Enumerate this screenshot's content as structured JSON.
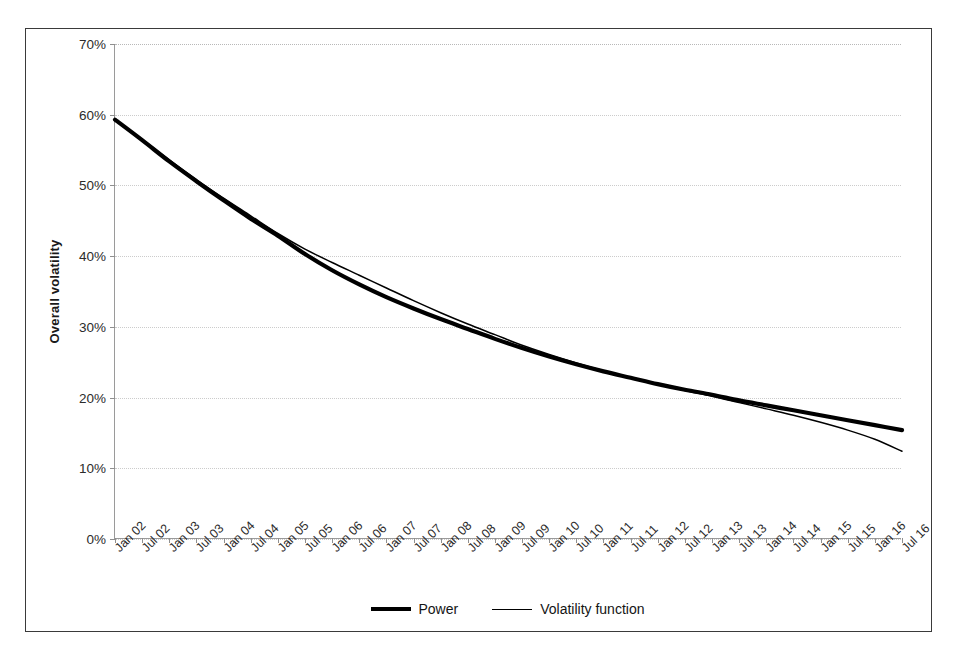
{
  "chart_data": {
    "type": "line",
    "title": "",
    "xlabel": "",
    "ylabel": "Overall volatility",
    "ylim": [
      0,
      0.7
    ],
    "ytick_labels": [
      "0%",
      "10%",
      "20%",
      "30%",
      "40%",
      "50%",
      "60%",
      "70%"
    ],
    "ytick_values": [
      0,
      10,
      20,
      30,
      40,
      50,
      60,
      70
    ],
    "grid": true,
    "legend_position": "bottom-center",
    "categories": [
      "Jan 02",
      "Jul 02",
      "Jan 03",
      "Jul 03",
      "Jan 04",
      "Jul 04",
      "Jan 05",
      "Jul 05",
      "Jan 06",
      "Jul 06",
      "Jan 07",
      "Jul 07",
      "Jan 08",
      "Jul 08",
      "Jan 09",
      "Jul 09",
      "Jan 10",
      "Jul 10",
      "Jan 11",
      "Jul 11",
      "Jan 12",
      "Jul 12",
      "Jan 13",
      "Jul 13",
      "Jan 14",
      "Jul 14",
      "Jan 15",
      "Jul 15",
      "Jan 16",
      "Jul 16"
    ],
    "series": [
      {
        "name": "Power",
        "style": "thick",
        "color": "#000000",
        "values": [
          59.3,
          56.4,
          53.4,
          50.6,
          47.9,
          45.3,
          42.9,
          40.3,
          38.0,
          36.0,
          34.2,
          32.6,
          31.1,
          29.7,
          28.3,
          27.0,
          25.8,
          24.7,
          23.7,
          22.8,
          21.9,
          21.1,
          20.4,
          19.6,
          18.9,
          18.2,
          17.5,
          16.8,
          16.1,
          15.4
        ]
      },
      {
        "name": "Volatility function",
        "style": "thin",
        "color": "#000000",
        "values": [
          59.3,
          56.5,
          53.6,
          50.8,
          48.2,
          45.7,
          43.2,
          41.0,
          39.1,
          37.3,
          35.5,
          33.7,
          32.0,
          30.4,
          28.9,
          27.4,
          26.1,
          24.9,
          23.8,
          22.8,
          21.9,
          21.0,
          20.2,
          19.3,
          18.4,
          17.5,
          16.5,
          15.4,
          14.1,
          12.4
        ]
      }
    ]
  },
  "legend": {
    "items": [
      {
        "label": "Power"
      },
      {
        "label": "Volatility function"
      }
    ]
  }
}
